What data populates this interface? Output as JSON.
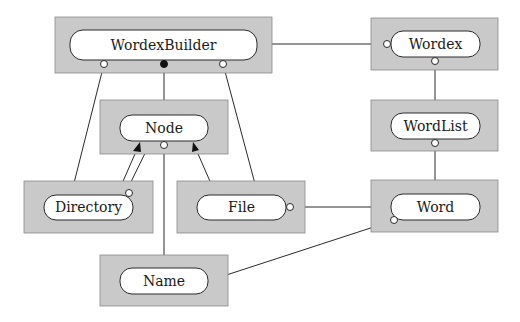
{
  "diagram": {
    "title": "",
    "nodes": [
      {
        "id": "wordexbuilder",
        "label": "WordexBuilder"
      },
      {
        "id": "wordex",
        "label": "Wordex"
      },
      {
        "id": "wordlist",
        "label": "WordList"
      },
      {
        "id": "node",
        "label": "Node"
      },
      {
        "id": "directory",
        "label": "Directory"
      },
      {
        "id": "file",
        "label": "File"
      },
      {
        "id": "word",
        "label": "Word"
      },
      {
        "id": "name",
        "label": "Name"
      }
    ],
    "edges": [
      {
        "from": "wordexbuilder",
        "to": "wordex",
        "end": "open-circle-at-wordex"
      },
      {
        "from": "wordexbuilder",
        "to": "node",
        "end": "filled-circle-at-wordexbuilder"
      },
      {
        "from": "wordexbuilder",
        "to": "directory",
        "end": "open-circle-at-wordexbuilder"
      },
      {
        "from": "wordexbuilder",
        "to": "file",
        "end": "open-circle-at-wordexbuilder"
      },
      {
        "from": "wordex",
        "to": "wordlist",
        "end": "open-circle-at-wordex"
      },
      {
        "from": "wordlist",
        "to": "word",
        "end": "open-circle-at-wordlist"
      },
      {
        "from": "directory",
        "to": "node",
        "end": "arrow-inheritance"
      },
      {
        "from": "directory",
        "to": "node",
        "end": "open-circle-at-directory"
      },
      {
        "from": "file",
        "to": "node",
        "end": "arrow-inheritance"
      },
      {
        "from": "node",
        "to": "name",
        "end": "open-circle-at-node"
      },
      {
        "from": "file",
        "to": "word",
        "end": "open-circle-at-file"
      },
      {
        "from": "name",
        "to": "word",
        "end": "open-circle-at-word"
      }
    ]
  }
}
